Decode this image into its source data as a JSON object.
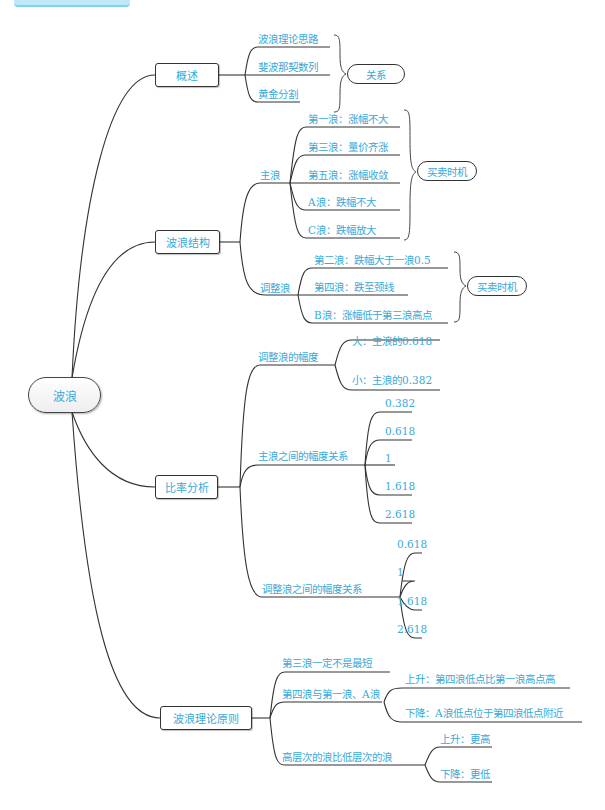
{
  "header": {
    "label": ""
  },
  "root": {
    "label": "波浪"
  },
  "branches": [
    {
      "label": "概述",
      "children": [
        {
          "label": "波浪理论思路"
        },
        {
          "label": "斐波那契数列"
        },
        {
          "label": "黄金分割"
        }
      ],
      "summary": "关系"
    },
    {
      "label": "波浪结构",
      "children": [
        {
          "label": "主浪",
          "children": [
            {
              "label": "第一浪：涨幅不大"
            },
            {
              "label": "第三浪：量价齐涨"
            },
            {
              "label": "第五浪：涨幅收敛"
            },
            {
              "label": "A浪：跌幅不大"
            },
            {
              "label": "C浪：跌幅放大"
            }
          ],
          "summary": "买卖时机"
        },
        {
          "label": "调整浪",
          "children": [
            {
              "label": "第二浪：跌幅大于一浪0.5"
            },
            {
              "label": "第四浪：跌至颈线"
            },
            {
              "label": "B浪：涨幅低于第三浪高点"
            }
          ],
          "summary": "买卖时机"
        }
      ]
    },
    {
      "label": "比率分析",
      "children": [
        {
          "label": "调整浪的幅度",
          "children": [
            {
              "label": "大：主浪的0.618"
            },
            {
              "label": "小：主浪的0.382"
            }
          ]
        },
        {
          "label": "主浪之间的幅度关系",
          "children": [
            {
              "label": "0.382"
            },
            {
              "label": "0.618"
            },
            {
              "label": "1"
            },
            {
              "label": "1.618"
            },
            {
              "label": "2.618"
            }
          ]
        },
        {
          "label": "调整浪之间的幅度关系",
          "children": [
            {
              "label": "0.618"
            },
            {
              "label": "1"
            },
            {
              "label": "1.618"
            },
            {
              "label": "2.618"
            }
          ]
        }
      ]
    },
    {
      "label": "波浪理论原则",
      "children": [
        {
          "label": "第三浪一定不是最短"
        },
        {
          "label": "第四浪与第一浪、A浪",
          "children": [
            {
              "label": "上升：第四浪低点比第一浪高点高"
            },
            {
              "label": "下降：A浪低点位于第四浪低点附近"
            }
          ]
        },
        {
          "label": "高层次的浪比低层次的浪",
          "children": [
            {
              "label": "上升：更高"
            },
            {
              "label": "下降：更低"
            }
          ]
        }
      ]
    }
  ],
  "colors": {
    "text": "#3aa9d8",
    "line": "#333333",
    "header": "#bfe9f7"
  }
}
